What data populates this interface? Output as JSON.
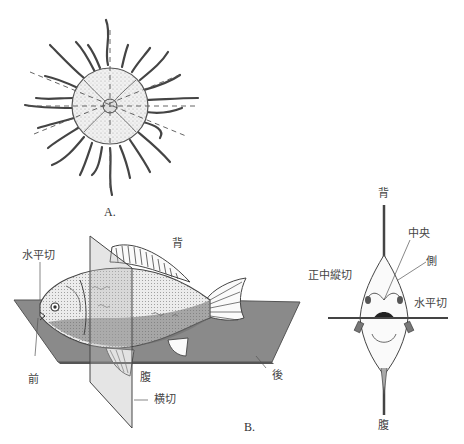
{
  "figure": {
    "panel_a": {
      "caption": "A.",
      "subject": "jellyfish (radial symmetry)",
      "planes": "dashed-symmetry-planes"
    },
    "panel_b": {
      "caption": "B.",
      "subject": "fish (bilateral symmetry)",
      "side_view_labels": {
        "dorsal": "背",
        "horizontal_section": "水平切",
        "anterior": "前",
        "ventral": "腹",
        "transverse_section": "横切",
        "posterior": "後"
      },
      "front_view_labels": {
        "dorsal": "背",
        "median": "中央",
        "lateral": "側",
        "median_sagittal_section": "正中縱切",
        "horizontal_section": "水平切",
        "ventral": "腹"
      }
    },
    "colors": {
      "plane_fill": "#8a8a8a",
      "plane_edge": "#555555",
      "ink": "#333333"
    }
  }
}
